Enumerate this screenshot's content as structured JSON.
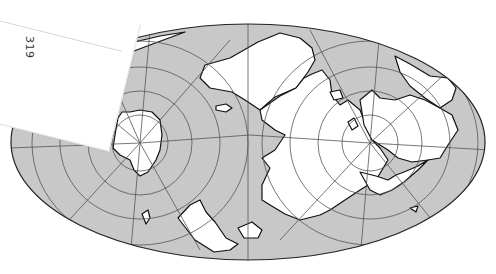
{
  "figure": {
    "type": "oblique equal-area world map (scanned)",
    "page_number": "319",
    "colors": {
      "ocean": "#c8c8c8",
      "land": "#ffffff",
      "coastline": "#111111",
      "graticule": "#555555",
      "background": "#ffffff"
    },
    "features": {
      "poles": [
        "pole-left-antarctica",
        "pole-right-arctic"
      ],
      "landmasses": [
        "Antarctica",
        "Australia",
        "South America",
        "Africa",
        "Eurasia",
        "North America",
        "Greenland"
      ]
    }
  }
}
